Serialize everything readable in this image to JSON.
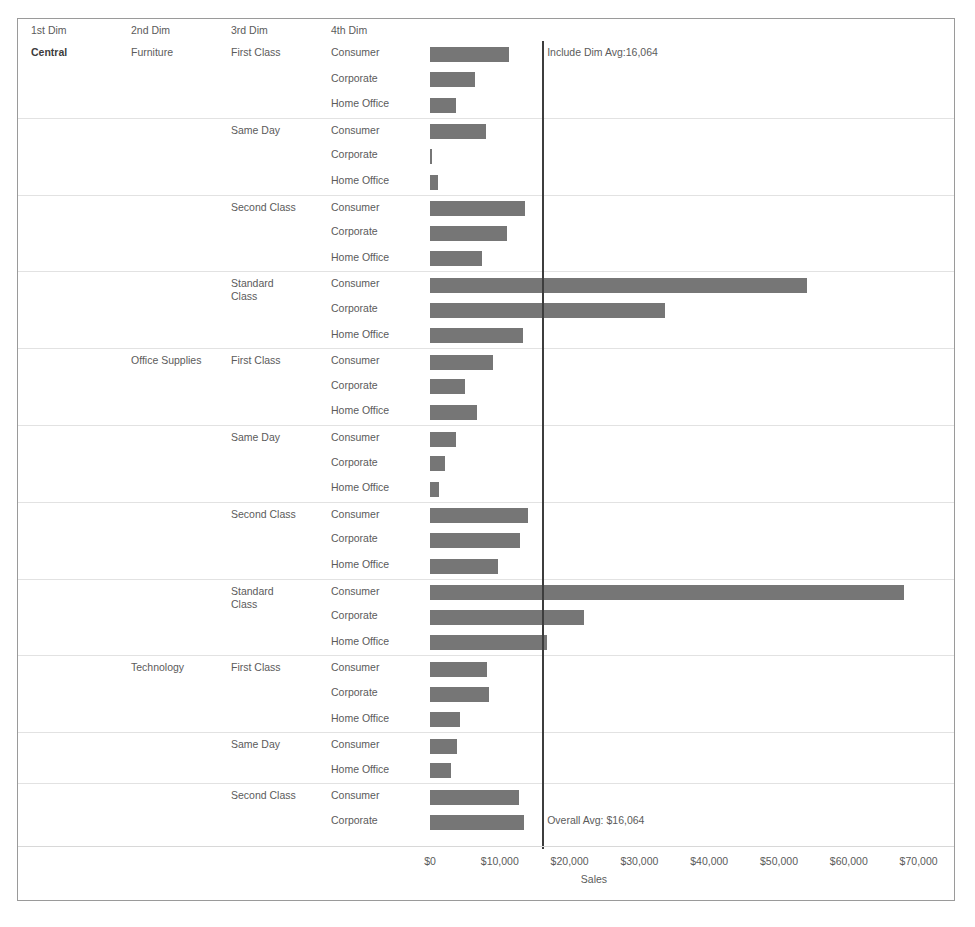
{
  "header": {
    "dim1": "1st Dim",
    "dim2": "2nd Dim",
    "dim3": "3rd Dim",
    "dim4": "4th Dim"
  },
  "reference_lines": {
    "top_label": "Include Dim Avg:16,064",
    "bottom_label": "Overall Avg: $16,064",
    "value": 16064,
    "color": "#3d3d3d"
  },
  "axis": {
    "title": "Sales",
    "ticks": [
      "$0",
      "$10,000",
      "$20,000",
      "$30,000",
      "$40,000",
      "$50,000",
      "$60,000",
      "$70,000"
    ],
    "tick_values": [
      0,
      10000,
      20000,
      30000,
      40000,
      50000,
      60000,
      70000
    ],
    "min": 0,
    "max": 73000
  },
  "colors": {
    "bar": "#767676",
    "text": "#5b5b5b",
    "gridline": "#e2e2e2",
    "border": "#9a9a9a"
  },
  "chart_data": {
    "type": "bar",
    "title": "",
    "xlabel": "Sales",
    "ylabel": "",
    "xlim": [
      0,
      73000
    ],
    "grid": true,
    "legend": "none",
    "orientation": "horizontal",
    "dimensions": [
      "1st Dim",
      "2nd Dim",
      "3rd Dim",
      "4th Dim"
    ],
    "reference_lines": [
      {
        "name": "Include Dim Avg:16,064",
        "value": 16064
      },
      {
        "name": "Overall Avg: $16,064",
        "value": 16064
      }
    ],
    "rows": [
      {
        "dim1": "Central",
        "dim2": "Furniture",
        "dim3": "First Class",
        "dim4": "Consumer",
        "value": 11300,
        "group_start": true
      },
      {
        "dim1": "",
        "dim2": "",
        "dim3": "",
        "dim4": "Corporate",
        "value": 6500
      },
      {
        "dim1": "",
        "dim2": "",
        "dim3": "",
        "dim4": "Home Office",
        "value": 3700
      },
      {
        "dim1": "",
        "dim2": "",
        "dim3": "Same Day",
        "dim4": "Consumer",
        "value": 8000,
        "group_start": true
      },
      {
        "dim1": "",
        "dim2": "",
        "dim3": "",
        "dim4": "Corporate",
        "value": 300
      },
      {
        "dim1": "",
        "dim2": "",
        "dim3": "",
        "dim4": "Home Office",
        "value": 1100
      },
      {
        "dim1": "",
        "dim2": "",
        "dim3": "Second Class",
        "dim4": "Consumer",
        "value": 13600,
        "group_start": true
      },
      {
        "dim1": "",
        "dim2": "",
        "dim3": "",
        "dim4": "Corporate",
        "value": 11000
      },
      {
        "dim1": "",
        "dim2": "",
        "dim3": "",
        "dim4": "Home Office",
        "value": 7400
      },
      {
        "dim1": "",
        "dim2": "",
        "dim3": "Standard\nClass",
        "dim4": "Consumer",
        "value": 54000,
        "group_start": true
      },
      {
        "dim1": "",
        "dim2": "",
        "dim3": "",
        "dim4": "Corporate",
        "value": 33700
      },
      {
        "dim1": "",
        "dim2": "",
        "dim3": "",
        "dim4": "Home Office",
        "value": 13300
      },
      {
        "dim1": "",
        "dim2": "Office Supplies",
        "dim3": "First Class",
        "dim4": "Consumer",
        "value": 9000,
        "group_start": true
      },
      {
        "dim1": "",
        "dim2": "",
        "dim3": "",
        "dim4": "Corporate",
        "value": 5000
      },
      {
        "dim1": "",
        "dim2": "",
        "dim3": "",
        "dim4": "Home Office",
        "value": 6800
      },
      {
        "dim1": "",
        "dim2": "",
        "dim3": "Same Day",
        "dim4": "Consumer",
        "value": 3700,
        "group_start": true
      },
      {
        "dim1": "",
        "dim2": "",
        "dim3": "",
        "dim4": "Corporate",
        "value": 2100
      },
      {
        "dim1": "",
        "dim2": "",
        "dim3": "",
        "dim4": "Home Office",
        "value": 1300
      },
      {
        "dim1": "",
        "dim2": "",
        "dim3": "Second Class",
        "dim4": "Consumer",
        "value": 14000,
        "group_start": true
      },
      {
        "dim1": "",
        "dim2": "",
        "dim3": "",
        "dim4": "Corporate",
        "value": 12900
      },
      {
        "dim1": "",
        "dim2": "",
        "dim3": "",
        "dim4": "Home Office",
        "value": 9700
      },
      {
        "dim1": "",
        "dim2": "",
        "dim3": "Standard\nClass",
        "dim4": "Consumer",
        "value": 67900,
        "group_start": true
      },
      {
        "dim1": "",
        "dim2": "",
        "dim3": "",
        "dim4": "Corporate",
        "value": 22000
      },
      {
        "dim1": "",
        "dim2": "",
        "dim3": "",
        "dim4": "Home Office",
        "value": 16700
      },
      {
        "dim1": "",
        "dim2": "Technology",
        "dim3": "First Class",
        "dim4": "Consumer",
        "value": 8100,
        "group_start": true
      },
      {
        "dim1": "",
        "dim2": "",
        "dim3": "",
        "dim4": "Corporate",
        "value": 8400
      },
      {
        "dim1": "",
        "dim2": "",
        "dim3": "",
        "dim4": "Home Office",
        "value": 4300
      },
      {
        "dim1": "",
        "dim2": "",
        "dim3": "Same Day",
        "dim4": "Consumer",
        "value": 3900,
        "group_start": true
      },
      {
        "dim1": "",
        "dim2": "",
        "dim3": "",
        "dim4": "Home Office",
        "value": 3000
      },
      {
        "dim1": "",
        "dim2": "",
        "dim3": "Second Class",
        "dim4": "Consumer",
        "value": 12700,
        "group_start": true
      },
      {
        "dim1": "",
        "dim2": "",
        "dim3": "",
        "dim4": "Corporate",
        "value": 13400
      }
    ]
  }
}
